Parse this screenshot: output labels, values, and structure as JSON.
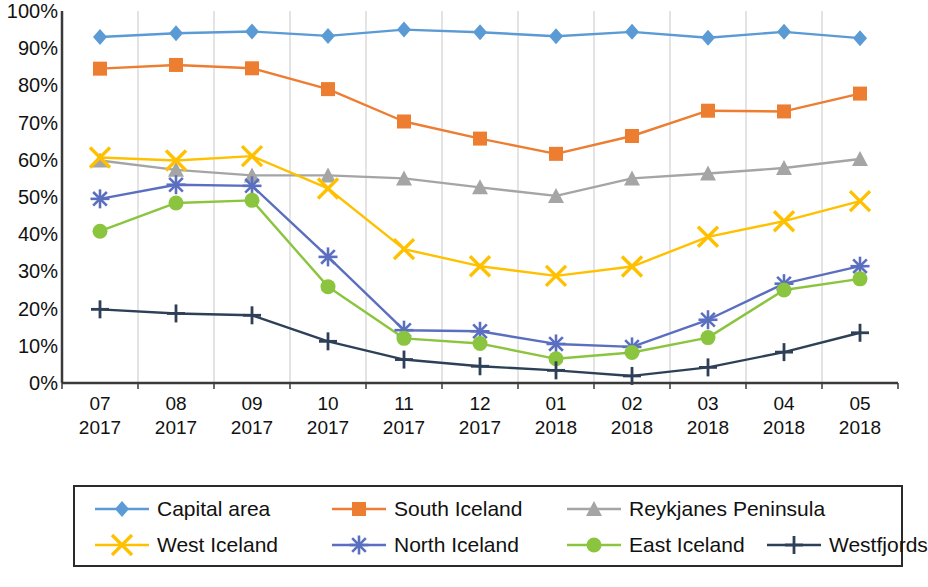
{
  "chart_data": {
    "type": "line",
    "title": "",
    "subtitle": "",
    "xlabel": "",
    "ylabel": "",
    "grid": "vertical",
    "legend_position": "bottom",
    "ylim": [
      0,
      100
    ],
    "ytick_labels": [
      "100%",
      "90%",
      "80%",
      "70%",
      "60%",
      "50%",
      "40%",
      "30%",
      "20%",
      "10%",
      "0%"
    ],
    "ytick_values": [
      100,
      90,
      80,
      70,
      60,
      50,
      40,
      30,
      20,
      10,
      0
    ],
    "categories": [
      {
        "month": "07",
        "year": "2017"
      },
      {
        "month": "08",
        "year": "2017"
      },
      {
        "month": "09",
        "year": "2017"
      },
      {
        "month": "10",
        "year": "2017"
      },
      {
        "month": "11",
        "year": "2017"
      },
      {
        "month": "12",
        "year": "2017"
      },
      {
        "month": "01",
        "year": "2018"
      },
      {
        "month": "02",
        "year": "2018"
      },
      {
        "month": "03",
        "year": "2018"
      },
      {
        "month": "04",
        "year": "2018"
      },
      {
        "month": "05",
        "year": "2018"
      }
    ],
    "series": [
      {
        "name": "Capital area",
        "color": "#5B9BD5",
        "marker": "diamond",
        "values": [
          93,
          94,
          94.5,
          93.3,
          95,
          94.3,
          93.2,
          94.4,
          92.8,
          94.4,
          92.7
        ]
      },
      {
        "name": "South Iceland",
        "color": "#ED7D31",
        "marker": "square",
        "values": [
          84.5,
          85.5,
          84.6,
          79,
          70.3,
          65.7,
          61.6,
          66.4,
          73.2,
          73,
          77.8
        ]
      },
      {
        "name": "Reykjanes Peninsula",
        "color": "#A5A5A5",
        "marker": "triangle",
        "values": [
          59.8,
          57.3,
          55.8,
          55.8,
          55,
          52.6,
          50.3,
          55,
          56.3,
          57.8,
          60.2
        ]
      },
      {
        "name": "West Iceland",
        "color": "#FFC000",
        "marker": "x",
        "values": [
          60.6,
          59.8,
          61,
          52.3,
          36,
          31.4,
          28.8,
          31.3,
          39.3,
          43.5,
          48.9
        ]
      },
      {
        "name": "North Iceland",
        "color": "#5B6FC0",
        "marker": "asterisk",
        "values": [
          49.5,
          53.3,
          53,
          33.9,
          14.2,
          13.9,
          10.5,
          9.7,
          17,
          26.7,
          31.4
        ]
      },
      {
        "name": "East Iceland",
        "color": "#8BC53F",
        "marker": "circle",
        "values": [
          40.8,
          48.4,
          49.1,
          25.9,
          12,
          10.6,
          6.5,
          8.2,
          12.2,
          25,
          28
        ]
      },
      {
        "name": "Westfjords",
        "color": "#2E4057",
        "marker": "plus",
        "values": [
          19.8,
          18.7,
          18.2,
          11.2,
          6.3,
          4.5,
          3.4,
          1.9,
          4.2,
          8.3,
          13.5
        ]
      }
    ]
  },
  "legend": {
    "row1": [
      {
        "label": "Capital area"
      },
      {
        "label": "South Iceland"
      },
      {
        "label": "Reykjanes Peninsula"
      }
    ],
    "row2": [
      {
        "label": "West Iceland"
      },
      {
        "label": "North Iceland"
      },
      {
        "label": "East Iceland"
      },
      {
        "label": "Westfjords"
      }
    ]
  }
}
